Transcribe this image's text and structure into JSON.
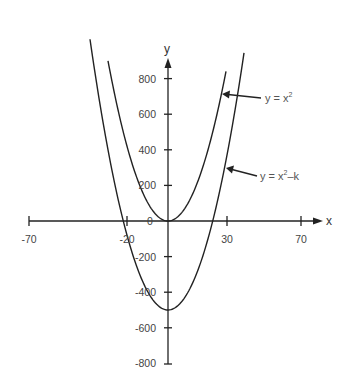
{
  "chart_data": {
    "type": "line",
    "title": "",
    "xlabel": "x",
    "ylabel": "y",
    "x_ticks": [
      -70,
      -20,
      30,
      70
    ],
    "y_ticks": [
      800,
      600,
      400,
      200,
      0,
      -200,
      -400,
      -600,
      -800
    ],
    "xlim": [
      -70,
      75
    ],
    "ylim": [
      -800,
      900
    ],
    "grid": false,
    "legend": "annotations with arrows",
    "series": [
      {
        "name": "y = x^2",
        "label_main": "y = x",
        "label_sup": "2",
        "label_tail": "",
        "formula": "x^2",
        "k": 0,
        "x_range": [
          -30,
          29
        ],
        "points": [
          [
            -30,
            900
          ],
          [
            -20,
            400
          ],
          [
            -10,
            100
          ],
          [
            0,
            0
          ],
          [
            10,
            100
          ],
          [
            20,
            400
          ],
          [
            29,
            841
          ]
        ]
      },
      {
        "name": "y = x^2 - k",
        "label_main": "y = x",
        "label_sup": "2",
        "label_tail": "–k",
        "formula": "x^2 - k",
        "k": 500,
        "x_range": [
          -39,
          38
        ],
        "points": [
          [
            -39,
            1021
          ],
          [
            -22.4,
            0
          ],
          [
            -10,
            -400
          ],
          [
            0,
            -500
          ],
          [
            10,
            -400
          ],
          [
            22.4,
            0
          ],
          [
            38,
            944
          ]
        ]
      }
    ],
    "annotations": [
      {
        "text": "y = x^2",
        "points_to": "y = x^2"
      },
      {
        "text": "y = x^2–k",
        "points_to": "y = x^2 - k"
      }
    ]
  },
  "axes": {
    "x_label": "x",
    "y_label": "y",
    "x_tick_labels": [
      "-70",
      "-20",
      "30",
      "70"
    ],
    "y_tick_labels_pos": [
      "800",
      "600",
      "400",
      "200"
    ],
    "zero_label": "0",
    "y_tick_labels_neg": [
      "-200",
      "-400",
      "-600",
      "-800"
    ]
  }
}
